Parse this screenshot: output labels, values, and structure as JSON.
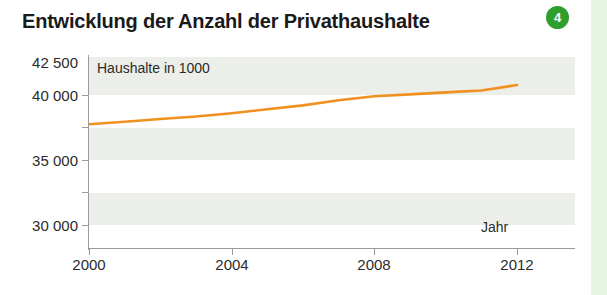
{
  "header": {
    "title": "Entwicklung der Anzahl der Privathaushalte",
    "badge": "4",
    "badge_color": "#2e9e2e"
  },
  "chart_data": {
    "type": "line",
    "title": "Entwicklung der Anzahl der Privathaushalte",
    "xlabel": "Jahr",
    "ylabel": "",
    "series_label": "Haushalte in 1000",
    "line_color": "#f0901e",
    "grid": true,
    "grid_style": "alternating-horizontal-bands",
    "legend": "none",
    "xlim": [
      2000,
      2013
    ],
    "ylim": [
      29000,
      42500
    ],
    "yticks": [
      30000,
      35000,
      40000,
      42500
    ],
    "ytick_labels": [
      "30 000",
      "35 000",
      "40 000",
      "42 500"
    ],
    "yticks_minor": [
      32500,
      37500
    ],
    "xticks": [
      2000,
      2004,
      2008,
      2012
    ],
    "xtick_labels": [
      "2000",
      "2004",
      "2008",
      "2012"
    ],
    "series": [
      {
        "name": "Haushalte in 1000",
        "x": [
          2000,
          2001,
          2002,
          2003,
          2004,
          2005,
          2006,
          2007,
          2008,
          2009,
          2010,
          2011,
          2012
        ],
        "values": [
          37750,
          37950,
          38150,
          38350,
          38600,
          38900,
          39200,
          39600,
          39900,
          40050,
          40200,
          40350,
          40770
        ]
      }
    ]
  },
  "axis": {
    "y_labels": [
      "42 500",
      "40 000",
      "35 000",
      "30 000"
    ],
    "x_labels": [
      "2000",
      "2004",
      "2008",
      "2012"
    ],
    "x_axis_title": "Jahr",
    "series_caption": "Haushalte in 1000"
  }
}
